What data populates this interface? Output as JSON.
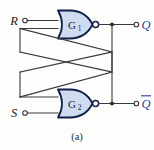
{
  "figure": {
    "caption": "(a)",
    "type": "logic-circuit-schematic",
    "colors": {
      "gate_fill": "#cfdcf0",
      "gate_outline": "#10204a",
      "wire": "#3a3a3c",
      "output_label": "#2a3f9d",
      "input_label": "#19191b",
      "background": "#fdfdfc"
    }
  },
  "gates": [
    {
      "id": "G1",
      "label": "G",
      "subscript": "1",
      "type": "NOR",
      "position": "top"
    },
    {
      "id": "G2",
      "label": "G",
      "subscript": "2",
      "type": "NOR",
      "position": "bottom"
    }
  ],
  "inputs": [
    {
      "id": "R",
      "label": "R",
      "gate": "G1",
      "position": "top-left"
    },
    {
      "id": "S",
      "label": "S",
      "gate": "G2",
      "position": "bottom-left"
    }
  ],
  "outputs": [
    {
      "id": "Q",
      "label": "Q",
      "overbar": false,
      "gate": "G1",
      "position": "top-right"
    },
    {
      "id": "Qbar",
      "label": "Q",
      "overbar": true,
      "gate": "G2",
      "position": "bottom-right"
    }
  ],
  "connections": [
    {
      "from": "G1-output",
      "to": "G2-input-upper",
      "kind": "cross-coupled-feedback"
    },
    {
      "from": "G2-output",
      "to": "G1-input-lower",
      "kind": "cross-coupled-feedback"
    }
  ]
}
